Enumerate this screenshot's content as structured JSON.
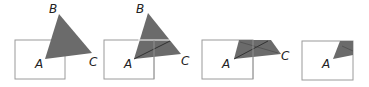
{
  "figure": {
    "fill_color": "#6b6b6b",
    "rect_stroke": "#999999",
    "panels": [
      {
        "labels": {
          "A": "A",
          "B": "B",
          "C": "C"
        }
      },
      {
        "labels": {
          "A": "A",
          "B": "B",
          "C": "C"
        }
      },
      {
        "labels": {
          "A": "A",
          "C": "C"
        }
      },
      {
        "labels": {
          "A": "A"
        }
      }
    ]
  }
}
